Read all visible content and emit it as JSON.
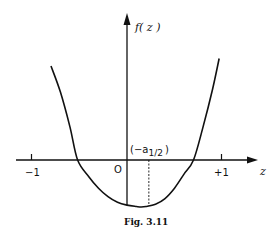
{
  "chart_data": {
    "type": "line",
    "title": "",
    "caption": "Fig. 3.11",
    "xlabel": "z",
    "ylabel": "f( z )",
    "xlim": [
      -1.15,
      1.35
    ],
    "ylim": [
      -0.5,
      1.55
    ],
    "grid": false,
    "legend": "none",
    "x_ticks": [
      {
        "value": -1,
        "label": "−1"
      },
      {
        "value": 1,
        "label": "+1"
      }
    ],
    "origin_label": "O",
    "annotation": {
      "text_main": "(−a",
      "text_sub": "1/2",
      "text_close": ")",
      "x": 0.23,
      "style": "dashed vertical line from axis to curve"
    },
    "series": [
      {
        "name": "f(z)",
        "x": [
          -0.8,
          -0.7,
          -0.6,
          -0.52,
          -0.4,
          -0.3,
          -0.2,
          -0.1,
          0.0,
          0.1,
          0.15,
          0.2,
          0.3,
          0.4,
          0.5,
          0.6,
          0.7,
          0.8,
          0.9,
          0.97
        ],
        "y": [
          1.0,
          0.72,
          0.35,
          0.0,
          -0.18,
          -0.3,
          -0.39,
          -0.45,
          -0.48,
          -0.495,
          -0.5,
          -0.495,
          -0.47,
          -0.41,
          -0.3,
          -0.15,
          0.0,
          0.35,
          0.75,
          1.08
        ]
      }
    ],
    "color": "#111111"
  }
}
